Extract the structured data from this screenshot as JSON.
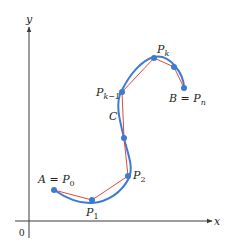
{
  "diagram": {
    "colors": {
      "background": "#ffffff",
      "axis": "#3a3a3a",
      "curve": "#3b7bd4",
      "polygon": "#e2483a",
      "points": "#3b7bd4",
      "text": "#231f20"
    },
    "axes": {
      "x_label": "x",
      "y_label": "y",
      "origin_label": "0"
    },
    "curve_label": "C",
    "points": [
      {
        "id": "P0",
        "label_main": "A = P",
        "label_sub": "0",
        "x": 54,
        "y": 190
      },
      {
        "id": "P1",
        "label_main": "P",
        "label_sub": "1",
        "x": 92,
        "y": 200
      },
      {
        "id": "P2",
        "label_main": "P",
        "label_sub": "2",
        "x": 128,
        "y": 176
      },
      {
        "id": "Pmid",
        "label_main": "",
        "label_sub": "",
        "x": 124,
        "y": 138
      },
      {
        "id": "Pk-1",
        "label_main": "P",
        "label_sub": "k−1",
        "x": 122,
        "y": 92
      },
      {
        "id": "Pk",
        "label_main": "P",
        "label_sub": "k",
        "x": 154,
        "y": 58
      },
      {
        "id": "Pk+1",
        "label_main": "",
        "label_sub": "",
        "x": 174,
        "y": 67
      },
      {
        "id": "Pn",
        "label_main": "B = P",
        "label_sub": "n",
        "x": 184,
        "y": 88
      }
    ]
  }
}
